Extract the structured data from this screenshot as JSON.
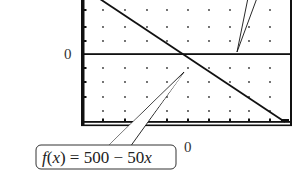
{
  "chart_data": {
    "type": "line",
    "title": "",
    "xlabel": "",
    "ylabel": "",
    "function": "f(x) = 500 - 50x",
    "series": [
      {
        "name": "f(x) = 500 - 50x",
        "x": [
          0,
          5,
          10
        ],
        "values": [
          500,
          250,
          0
        ]
      }
    ],
    "tick_labels": {
      "y_zero": "0",
      "x_zero": "0"
    },
    "grid": "dots",
    "legend": "callout annotations",
    "annotations": [
      {
        "text": "f(x) = 500 − 50x",
        "position": "bottom-left callout pointing to line"
      },
      {
        "text": "",
        "position": "top-right callout pointing to x-axis line (label cropped)"
      }
    ]
  },
  "labels": {
    "y_axis_zero": "0",
    "x_axis_zero": "0",
    "function_label_prefix": "f",
    "function_label_paren_open": "(",
    "function_label_var": "x",
    "function_label_rest": ") = 500 − 50",
    "function_label_var2": "x"
  },
  "colors": {
    "line": "#111111",
    "frame": "#111111",
    "dots": "#333333",
    "background": "#ffffff"
  }
}
